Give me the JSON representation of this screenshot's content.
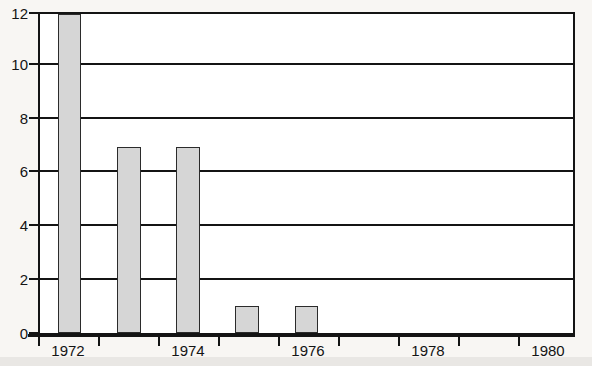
{
  "chart_data": {
    "type": "bar",
    "title": "",
    "subtitle": "",
    "xlabel": "",
    "ylabel": "",
    "categories": [
      "1972",
      "1973",
      "1974",
      "1975",
      "1976",
      "1977",
      "1978",
      "1979",
      "1980"
    ],
    "values": [
      12,
      7,
      7,
      1,
      1,
      0,
      0,
      0,
      0
    ],
    "ylim": [
      0,
      12
    ],
    "yticks": [
      0,
      2,
      4,
      6,
      8,
      10,
      12
    ],
    "ytick_labels": [
      "0",
      "2",
      "4",
      "6",
      "8",
      "10",
      "12"
    ],
    "xtick_labels": [
      "1972",
      "1974",
      "1976",
      "1978",
      "1980"
    ],
    "xtick_label_categories": [
      "1972",
      "1974",
      "1976",
      "1978",
      "1980"
    ],
    "grid": true,
    "grid_axis": "y",
    "legend": false,
    "legend_position": "none",
    "bar_fill_color": "#d6d6d6",
    "bar_edge_color": "#2b2b2b",
    "axis_color": "#141414",
    "plot_background": "#ffffff",
    "figure_background": "#f8f6f3"
  },
  "axes": {
    "y_labels": [
      "12",
      "10",
      "8",
      "6",
      "4",
      "2",
      "0"
    ],
    "x_labels": [
      "1972",
      "1974",
      "1976",
      "1978",
      "1980"
    ]
  }
}
